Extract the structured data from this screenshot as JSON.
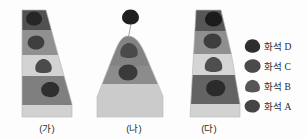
{
  "figure": {
    "title": "",
    "background_color": "#fdfdfd",
    "columns": [
      {
        "id": "ga",
        "caption": "(가)",
        "shape": "truncated-wedge",
        "layers": [
          {
            "name": "layer-1-top",
            "color": "#4a4a4a",
            "fossil": "fossil-A"
          },
          {
            "name": "layer-2",
            "color": "#8c8c8c",
            "fossil": "fossil-C"
          },
          {
            "name": "layer-3",
            "color": "#d2d2d2",
            "fossil": "fossil-B"
          },
          {
            "name": "layer-4",
            "color": "#7a7a7a",
            "fossil": "fossil-A"
          },
          {
            "name": "layer-5-bottom",
            "color": "#cfcfcf",
            "fossil": null
          }
        ]
      },
      {
        "id": "na",
        "caption": "(나)",
        "shape": "rounded-hill",
        "layers": [
          {
            "name": "layer-1-top",
            "color": "#7d7d7d",
            "fossil": "fossil-B"
          },
          {
            "name": "layer-2",
            "color": "#868686",
            "fossil": "fossil-C"
          },
          {
            "name": "layer-3-bottom",
            "color": "#c9c9c9",
            "fossil": null
          }
        ],
        "callout_fossil": "fossil-D",
        "callout_note": "fossil shown above summit with pointer line"
      },
      {
        "id": "da",
        "caption": "(다)",
        "shape": "truncated-wedge",
        "layers": [
          {
            "name": "layer-1-top",
            "color": "#4f4f4f",
            "fossil": "fossil-D"
          },
          {
            "name": "layer-2",
            "color": "#8a8a8a",
            "fossil": "fossil-C"
          },
          {
            "name": "layer-3",
            "color": "#d4d4d4",
            "fossil": "fossil-B"
          },
          {
            "name": "layer-4",
            "color": "#5c5c5c",
            "fossil": "fossil-A"
          },
          {
            "name": "layer-5-bottom",
            "color": "#d0d0d0",
            "fossil": null
          }
        ]
      }
    ]
  },
  "legend": {
    "items": [
      {
        "key": "fossil-D",
        "label": "화석 D",
        "color": "#2e2e2e"
      },
      {
        "key": "fossil-C",
        "label": "화석 C",
        "color": "#4a4a4a"
      },
      {
        "key": "fossil-B",
        "label": "화석 B",
        "color": "#565656"
      },
      {
        "key": "fossil-A",
        "label": "화석 A",
        "color": "#454545"
      }
    ]
  }
}
